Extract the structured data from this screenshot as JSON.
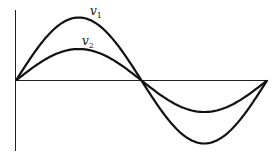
{
  "diagram": {
    "type": "line",
    "series": [
      {
        "name": "v1",
        "label_main": "v",
        "label_sub": "1",
        "relative_amplitude": 1.0,
        "phase_deg": 0,
        "cycles": 1
      },
      {
        "name": "v2",
        "label_main": "v",
        "label_sub": "2",
        "relative_amplitude": 0.5,
        "phase_deg": 0,
        "cycles": 1
      }
    ],
    "colors": {
      "line": "#111111",
      "axis": "#222222",
      "background": "#ffffff"
    }
  }
}
